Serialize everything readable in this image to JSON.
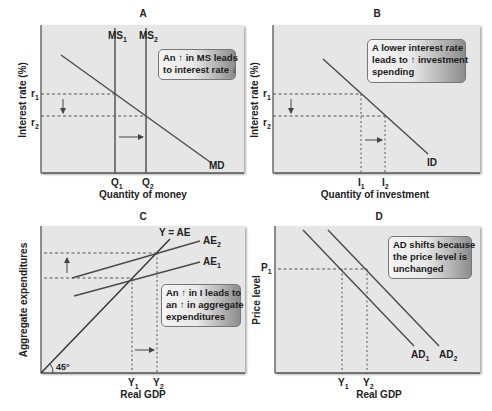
{
  "figure": {
    "panels": [
      {
        "id": "A",
        "title": "A",
        "xlabel": "Quantity of money",
        "ylabel": "Interest rate (%)",
        "y_ticks": [
          {
            "base": "r",
            "sub": "1"
          },
          {
            "base": "r",
            "sub": "2"
          }
        ],
        "x_ticks": [
          {
            "base": "Q",
            "sub": "1"
          },
          {
            "base": "Q",
            "sub": "2"
          }
        ],
        "curves": [
          {
            "base": "MS",
            "sub": "1"
          },
          {
            "base": "MS",
            "sub": "2"
          },
          {
            "base": "MD",
            "sub": ""
          }
        ],
        "callout": [
          "An ↑ in MS leads",
          "to interest rate ↓"
        ]
      },
      {
        "id": "B",
        "title": "B",
        "xlabel": "Quantity of investment",
        "ylabel": "Interest rate (%)",
        "y_ticks": [
          {
            "base": "r",
            "sub": "1"
          },
          {
            "base": "r",
            "sub": "2"
          }
        ],
        "x_ticks": [
          {
            "base": "I",
            "sub": "1"
          },
          {
            "base": "I",
            "sub": "2"
          }
        ],
        "curves": [
          {
            "base": "ID",
            "sub": ""
          }
        ],
        "callout": [
          "A lower interest rate",
          "leads to ↑ investment",
          "spending"
        ]
      },
      {
        "id": "C",
        "title": "C",
        "xlabel": "Real GDP",
        "ylabel": "Aggregate expenditures",
        "x_ticks": [
          {
            "base": "Y",
            "sub": "1"
          },
          {
            "base": "Y",
            "sub": "2"
          }
        ],
        "curves": [
          {
            "base": "Y = AE",
            "sub": ""
          },
          {
            "base": "AE",
            "sub": "2"
          },
          {
            "base": "AE",
            "sub": "1"
          }
        ],
        "angle_label": "45°",
        "callout": [
          "An ↑ in  I leads to",
          "an ↑ in aggregate",
          "expenditures"
        ]
      },
      {
        "id": "D",
        "title": "D",
        "xlabel": "Real GDP",
        "ylabel": "Price level",
        "y_ticks": [
          {
            "base": "P",
            "sub": "1"
          }
        ],
        "x_ticks": [
          {
            "base": "Y",
            "sub": "1"
          },
          {
            "base": "Y",
            "sub": "2"
          }
        ],
        "curves": [
          {
            "base": "AD",
            "sub": "1"
          },
          {
            "base": "AD",
            "sub": "2"
          }
        ],
        "callout": [
          "AD shifts because",
          "the price level is",
          "unchanged"
        ]
      }
    ]
  },
  "colors": {
    "plot_bg": "#e6e6e6",
    "line": "#4a4a4a",
    "dashed": "#555555",
    "text": "#222222"
  }
}
